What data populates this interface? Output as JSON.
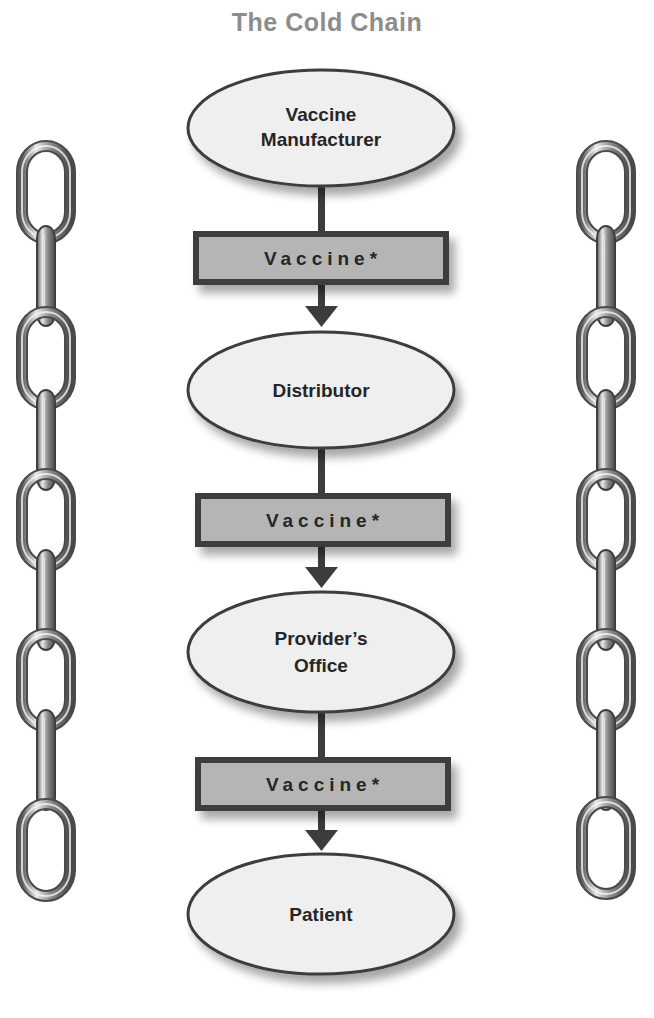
{
  "title": "The Cold Chain",
  "colors": {
    "title": "#8c8c8c",
    "outline": "#3c3c3c",
    "ellipse_fill": "#efefef",
    "box_fill": "#b5b5b5",
    "text": "#262626",
    "chain": "#7a7a7a"
  },
  "nodes": [
    {
      "lines": [
        "Vaccine",
        "Manufacturer"
      ]
    },
    {
      "lines": [
        "Distributor"
      ]
    },
    {
      "lines": [
        "Provider’s",
        "Office"
      ]
    },
    {
      "lines": [
        "Patient"
      ]
    }
  ],
  "connectors": [
    {
      "label": "Vaccine*"
    },
    {
      "label": "Vaccine*"
    },
    {
      "label": "Vaccine*"
    }
  ],
  "decorations": {
    "left_chain": "chain-icon",
    "right_chain": "chain-icon"
  }
}
